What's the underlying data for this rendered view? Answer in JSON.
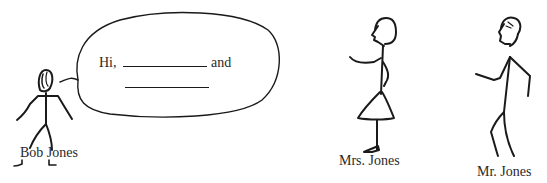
{
  "speech_bubble": {
    "greeting": "Hi,",
    "conjunction": "and",
    "blank_1": "",
    "blank_2": ""
  },
  "characters": [
    {
      "name": "Bob Jones",
      "role": "speaker"
    },
    {
      "name": "Mrs. Jones",
      "role": "listener"
    },
    {
      "name": "Mr. Jones",
      "role": "listener"
    }
  ],
  "colors": {
    "ink": "#1a1a1a",
    "background": "#ffffff"
  }
}
